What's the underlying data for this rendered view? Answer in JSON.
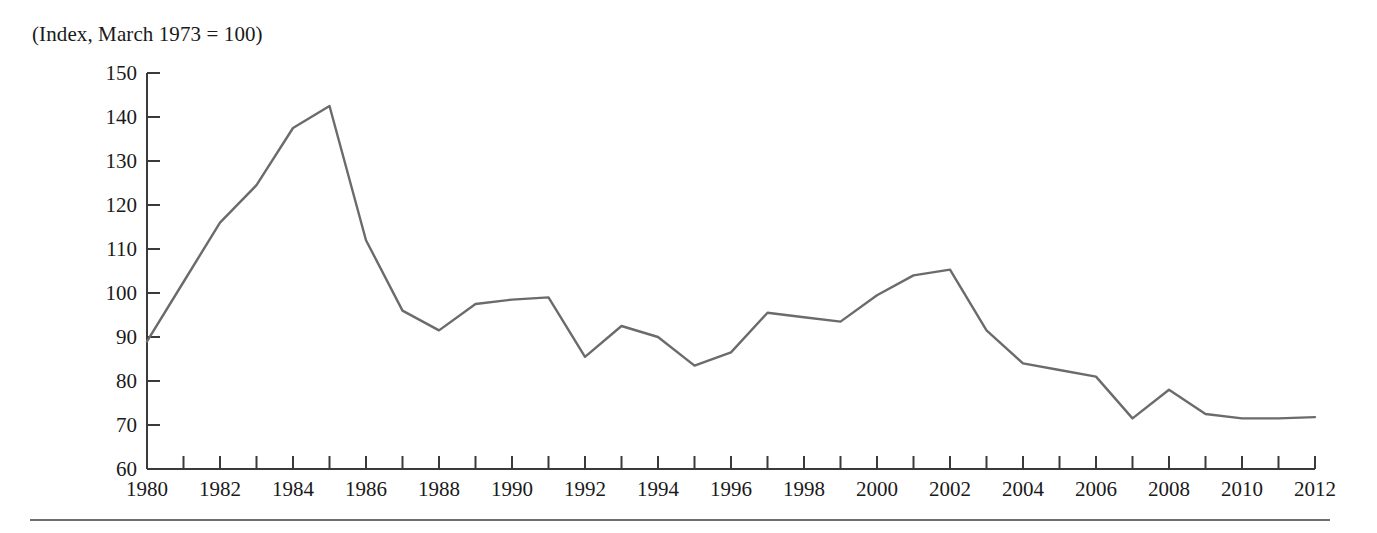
{
  "figure": {
    "title": "(Index, March 1973 = 100)",
    "line_color": "#6b6b6b",
    "axis_color": "#3a3a3a",
    "background_color": "#ffffff",
    "rule_color": "#6f6f6f"
  },
  "chart_data": {
    "type": "line",
    "title": "(Index, March 1973 = 100)",
    "xlabel": "",
    "ylabel": "",
    "xlim": [
      1980,
      2012
    ],
    "ylim": [
      60,
      150
    ],
    "y_ticks": [
      60,
      70,
      80,
      90,
      100,
      110,
      120,
      130,
      140,
      150
    ],
    "y_tick_labels": [
      "60",
      "70",
      "80",
      "90",
      "100",
      "110",
      "120",
      "130",
      "140",
      "150"
    ],
    "x_ticks": [
      1980,
      1981,
      1982,
      1983,
      1984,
      1985,
      1986,
      1987,
      1988,
      1989,
      1990,
      1991,
      1992,
      1993,
      1994,
      1995,
      1996,
      1997,
      1998,
      1999,
      2000,
      2001,
      2002,
      2003,
      2004,
      2005,
      2006,
      2007,
      2008,
      2009,
      2010,
      2011,
      2012
    ],
    "x_tick_labels": [
      "1980",
      "",
      "1982",
      "",
      "1984",
      "",
      "1986",
      "",
      "1988",
      "",
      "1990",
      "",
      "1992",
      "",
      "1994",
      "",
      "1996",
      "",
      "1998",
      "",
      "2000",
      "",
      "2002",
      "",
      "2004",
      "",
      "2006",
      "",
      "2008",
      "",
      "2010",
      "",
      "2012"
    ],
    "x_labeled_ticks": [
      1980,
      1982,
      1984,
      1986,
      1988,
      1990,
      1992,
      1994,
      1996,
      1998,
      2000,
      2002,
      2004,
      2006,
      2008,
      2010,
      2012
    ],
    "grid": false,
    "legend": false,
    "x": [
      1980,
      1981,
      1982,
      1983,
      1984,
      1985,
      1986,
      1987,
      1988,
      1989,
      1990,
      1991,
      1992,
      1993,
      1994,
      1995,
      1996,
      1997,
      1998,
      1999,
      2000,
      2001,
      2002,
      2003,
      2004,
      2005,
      2006,
      2007,
      2008,
      2009,
      2010,
      2011,
      2012
    ],
    "values": [
      89.0,
      102.5,
      116.0,
      124.5,
      137.5,
      142.5,
      112.0,
      96.0,
      91.5,
      97.5,
      98.5,
      99.0,
      85.5,
      92.5,
      90.0,
      83.5,
      86.5,
      95.5,
      94.5,
      93.5,
      99.5,
      104.0,
      105.3,
      91.5,
      84.0,
      82.5,
      81.0,
      71.5,
      78.0,
      72.5,
      71.5,
      71.5,
      71.8
    ],
    "series": [
      {
        "name": "Index",
        "color": "#6b6b6b",
        "values": [
          89.0,
          102.5,
          116.0,
          124.5,
          137.5,
          142.5,
          112.0,
          96.0,
          91.5,
          97.5,
          98.5,
          99.0,
          85.5,
          92.5,
          90.0,
          83.5,
          86.5,
          95.5,
          94.5,
          93.5,
          99.5,
          104.0,
          105.3,
          91.5,
          84.0,
          82.5,
          81.0,
          71.5,
          78.0,
          72.5,
          71.5,
          71.5,
          71.8
        ]
      }
    ]
  }
}
